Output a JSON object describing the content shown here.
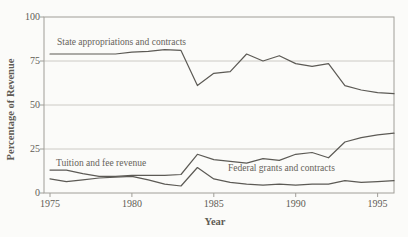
{
  "figure": {
    "background": "#fbfbf9",
    "text_color": "#5f5c55",
    "line_color": "#5c5a55",
    "grid_color": "#c6c4be",
    "border_color": "#a09e98"
  },
  "chart_data": {
    "type": "line",
    "title": "",
    "xlabel": "Year",
    "ylabel": "Percentage of Revenue",
    "xlim": [
      1975,
      1996
    ],
    "ylim": [
      0,
      100
    ],
    "xticks": [
      1975,
      1980,
      1985,
      1990,
      1995
    ],
    "yticks": [
      0,
      25,
      50,
      75,
      100
    ],
    "grid": "horizontal gridlines at 25, 50, 75; full box border",
    "legend": "inline text labels beside each line",
    "x": [
      1975,
      1976,
      1977,
      1978,
      1979,
      1980,
      1981,
      1982,
      1983,
      1984,
      1985,
      1986,
      1987,
      1988,
      1989,
      1990,
      1991,
      1992,
      1993,
      1994,
      1995,
      1996
    ],
    "series": [
      {
        "id": "state",
        "name": "State appropriations and contracts",
        "values": [
          79,
          79,
          79,
          79,
          79,
          80,
          80.5,
          81.5,
          81,
          61,
          68,
          69,
          79,
          75,
          78,
          73.5,
          72,
          73.5,
          61,
          58.5,
          57,
          56.5
        ]
      },
      {
        "id": "tuition",
        "name": "Tuition and fee revenue",
        "values": [
          13,
          13,
          11,
          9.5,
          9.5,
          10,
          10,
          10,
          10.5,
          22,
          19,
          18,
          17,
          19.5,
          18.5,
          22,
          23,
          20,
          29,
          31.5,
          33,
          34
        ]
      },
      {
        "id": "federal",
        "name": "Federal grants and contracts",
        "values": [
          8,
          6.5,
          7.5,
          8.5,
          9,
          9.5,
          7.5,
          5,
          4,
          14.5,
          8,
          6,
          5,
          4.5,
          5,
          4.5,
          5,
          5,
          7,
          6,
          6.5,
          7
        ]
      }
    ]
  }
}
